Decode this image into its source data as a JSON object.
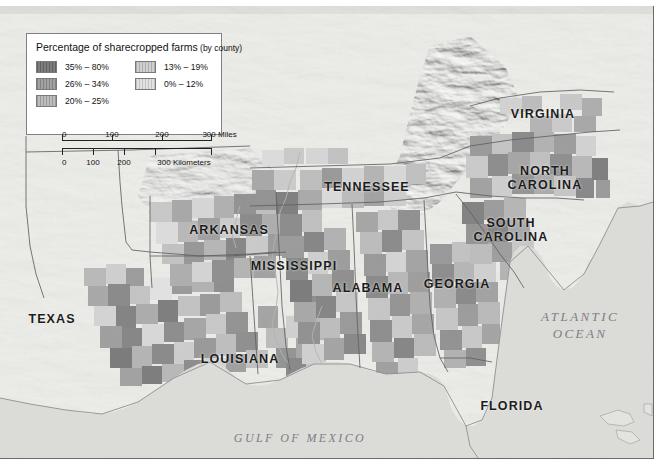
{
  "map": {
    "title_visible": false,
    "background_color": "#e9e9e6",
    "ocean_color": "#dcdcd8",
    "land_color": "#ebebe7",
    "border_color": "#6b6b6b"
  },
  "legend": {
    "title_main": "Percentage of sharecropped farms",
    "title_sub": " (by county)",
    "classes": [
      {
        "label": "35% – 80%",
        "color": "#7d7d7d",
        "swatch": "sw1"
      },
      {
        "label": "26% – 34%",
        "color": "#a2a2a2",
        "swatch": "sw2"
      },
      {
        "label": "20% – 25%",
        "color": "#bdbdbd",
        "swatch": "sw3"
      },
      {
        "label": "13% – 19%",
        "color": "#cfcfcf",
        "swatch": "sw4"
      },
      {
        "label": "0% – 12%",
        "color": "#e2e2e2",
        "swatch": "sw5"
      }
    ],
    "scale_miles": {
      "unit_label": "300 Miles",
      "ticks": [
        "0",
        "100",
        "200",
        "300"
      ]
    },
    "scale_km": {
      "unit_label": "300 Kilometers",
      "ticks": [
        "0",
        "100",
        "200",
        "300"
      ]
    }
  },
  "state_labels": [
    {
      "name": "virginia",
      "text": "VIRGINIA",
      "x": 543,
      "y": 108
    },
    {
      "name": "north-carolina",
      "text": "NORTH\nCAROLINA",
      "x": 545,
      "y": 165
    },
    {
      "name": "south-carolina",
      "text": "SOUTH\nCAROLINA",
      "x": 511,
      "y": 217
    },
    {
      "name": "tennessee",
      "text": "TENNESSEE",
      "x": 367,
      "y": 181
    },
    {
      "name": "arkansas",
      "text": "ARKANSAS",
      "x": 229,
      "y": 224
    },
    {
      "name": "mississippi",
      "text": "MISSISSIPPI",
      "x": 294,
      "y": 260
    },
    {
      "name": "alabama",
      "text": "ALABAMA",
      "x": 368,
      "y": 282
    },
    {
      "name": "georgia",
      "text": "GEORGIA",
      "x": 457,
      "y": 278
    },
    {
      "name": "louisiana",
      "text": "LOUISIANA",
      "x": 240,
      "y": 353
    },
    {
      "name": "texas",
      "text": "TEXAS",
      "x": 52,
      "y": 313
    },
    {
      "name": "florida",
      "text": "FLORIDA",
      "x": 512,
      "y": 400
    }
  ],
  "water_labels": [
    {
      "name": "atlantic-ocean",
      "text": "ATLANTIC\nOCEAN",
      "x": 580,
      "y": 310,
      "size": 13
    },
    {
      "name": "gulf-of-mexico",
      "text": "GULF OF MEXICO",
      "x": 300,
      "y": 432,
      "size": 12
    }
  ]
}
